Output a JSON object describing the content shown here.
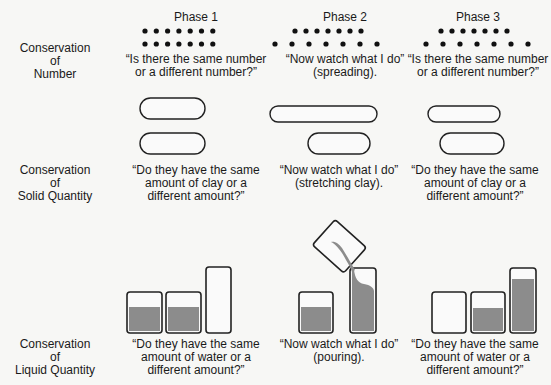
{
  "phases": [
    {
      "label": "Phase 1"
    },
    {
      "label": "Phase 2"
    },
    {
      "label": "Phase 3"
    }
  ],
  "rows": [
    {
      "name": "number",
      "label": "Conservation\nof\nNumber",
      "captions": [
        "“Is there the same number\nor a different number?”",
        "“Now watch what I do”\n(spreading).",
        "“Is there the same number\nor a different number?”"
      ]
    },
    {
      "name": "solid-quantity",
      "label": "Conservation\nof\nSolid Quantity",
      "captions": [
        "“Do they have the same\namount of clay or a\ndifferent amount?”",
        "“Now watch what I do”\n(stretching clay).",
        "“Do they have the same\namount of clay or a\ndifferent amount?”"
      ]
    },
    {
      "name": "liquid-quantity",
      "label": "Conservation\nof\nLiquid Quantity",
      "captions": [
        "“Do they have the same\namount of water or a\ndifferent amount?”",
        "“Now watch what I do”\n(pouring).",
        "“Do they have the same\namount of water or a\ndifferent amount?”"
      ]
    }
  ],
  "illustration": {
    "dots_per_row": 7,
    "liquid_color": "#8c8c8c",
    "outline_color": "#222222"
  }
}
